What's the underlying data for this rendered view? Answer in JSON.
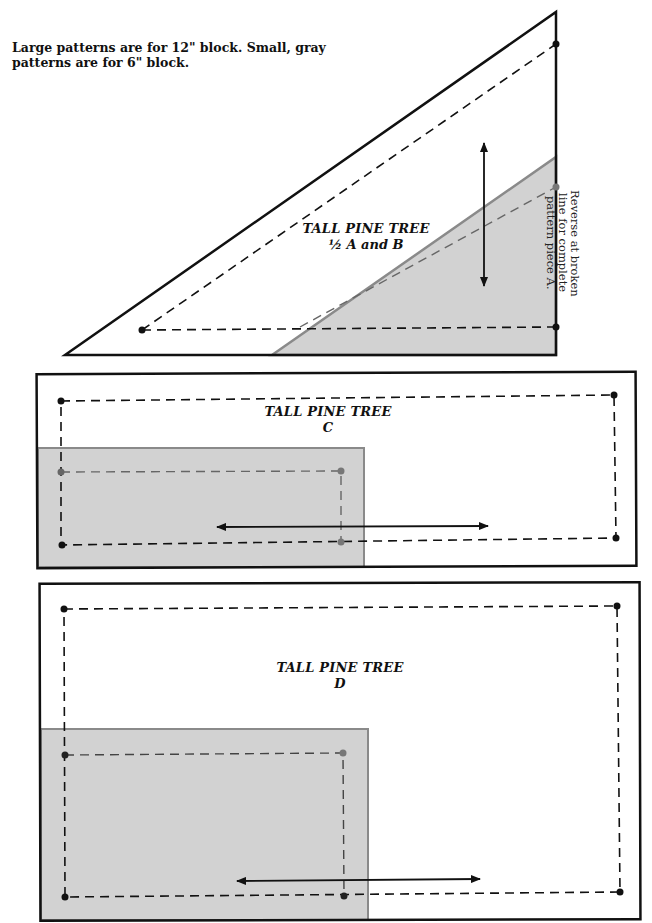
{
  "note": "Large patterns are for 12\" block. Small, gray patterns are for 6\" block.",
  "pieces": {
    "ab": {
      "title": "TALL PINE TREE",
      "subtitle": "½ A and B",
      "instruction": "Reverse at broken line for complete pattern piece A."
    },
    "c": {
      "title": "TALL PINE TREE",
      "subtitle": "C"
    },
    "d": {
      "title": "TALL PINE TREE",
      "subtitle": "D"
    }
  },
  "colors": {
    "gray_fill": "#d2d2d2",
    "gray_stroke": "#8a8a8a",
    "ink": "#111111"
  }
}
